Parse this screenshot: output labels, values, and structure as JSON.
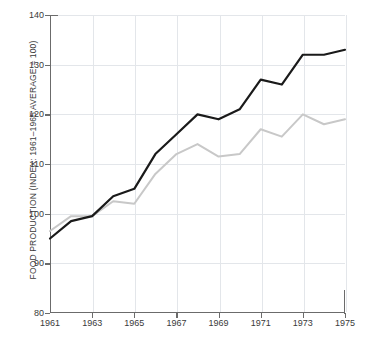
{
  "chart_data": {
    "type": "line",
    "title": "",
    "xlabel": "",
    "ylabel": "FOOD PRODUCTION (INDEX: 1961–1965 AVERAGE = 100)",
    "ylim": [
      80,
      140
    ],
    "xlim": [
      1961,
      1975
    ],
    "yticks": [
      80,
      90,
      100,
      110,
      120,
      130,
      140
    ],
    "xticks": [
      1961,
      1963,
      1965,
      1967,
      1969,
      1971,
      1973,
      1975
    ],
    "grid": true,
    "legend": "none",
    "x": [
      1961,
      1962,
      1963,
      1964,
      1965,
      1966,
      1967,
      1968,
      1969,
      1970,
      1971,
      1972,
      1973,
      1974,
      1975
    ],
    "series": [
      {
        "name": "total-food-production",
        "color": "#1a1a1a",
        "values": [
          95.0,
          98.5,
          99.5,
          103.5,
          105.0,
          112.0,
          116.0,
          120.0,
          119.0,
          121.0,
          127.0,
          126.0,
          132.0,
          132.0,
          133.0
        ]
      },
      {
        "name": "per-capita-food-production",
        "color": "#c8c8c8",
        "values": [
          96.5,
          99.5,
          99.5,
          102.5,
          102.0,
          108.0,
          112.0,
          114.0,
          111.5,
          112.0,
          117.0,
          115.5,
          120.0,
          118.0,
          119.0
        ]
      }
    ]
  },
  "axes": {
    "y_title": "FOOD PRODUCTION (INDEX: 1961–1965 AVERAGE = 100)",
    "y_tick_labels": [
      "140",
      "130",
      "120",
      "110",
      "100",
      "90",
      "80"
    ],
    "x_tick_labels": [
      "1961",
      "1963",
      "1965",
      "1967",
      "1969",
      "1971",
      "1973",
      "1975"
    ]
  },
  "colors": {
    "series_dark": "#1a1a1a",
    "series_light": "#c8c8c8",
    "axis": "#6b6b6b",
    "grid": "#e3e6ea",
    "text": "#3a3a3a",
    "background": "#ffffff"
  }
}
